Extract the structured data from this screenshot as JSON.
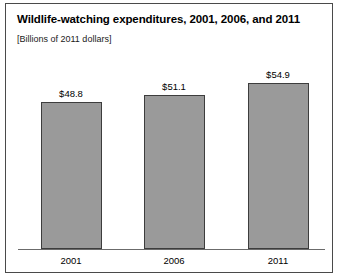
{
  "chart_data": {
    "type": "bar",
    "title": "Wildlife-watching expenditures, 2001, 2006, and 2011",
    "subtitle": "[Billions of 2011 dollars]",
    "xlabel": "",
    "ylabel": "",
    "categories": [
      "2001",
      "2006",
      "2011"
    ],
    "values": [
      48.8,
      51.1,
      54.9
    ],
    "data_labels": [
      "$48.8",
      "$51.1",
      "$54.9"
    ],
    "ylim": [
      0,
      62
    ],
    "grid": false,
    "legend": "none",
    "bar_color": "#9a9a9a",
    "bar_border_color": "#3d3d3d",
    "axis_color": "#6b6b6b",
    "frame_color": "#4a4a4a",
    "text_color": "#000000"
  }
}
